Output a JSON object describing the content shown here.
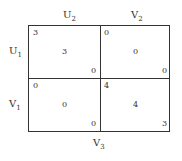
{
  "column_labels": [
    {
      "base": "U",
      "sub": "2"
    },
    {
      "base": "V",
      "sub": "2"
    }
  ],
  "row_labels": [
    {
      "base": "U",
      "sub": "1"
    },
    {
      "base": "V",
      "sub": "1"
    }
  ],
  "bottom_label": {
    "base": "V",
    "sub": "3"
  },
  "cells": [
    {
      "top_left": "3",
      "center": "3",
      "bottom_right": "0"
    },
    {
      "top_left": "0",
      "center": "0",
      "bottom_right": "0"
    },
    {
      "top_left": "0",
      "center": "0",
      "bottom_right": "0"
    },
    {
      "top_left": "4",
      "center": "4",
      "bottom_right": "3"
    }
  ]
}
